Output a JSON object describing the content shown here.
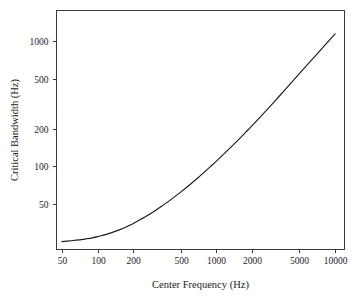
{
  "chart_data": {
    "type": "line",
    "title": "",
    "subtitle": "",
    "xlabel": "Center Frequency (Hz)",
    "ylabel": "Critical Bandwidth (Hz)",
    "xscale": "log",
    "yscale": "log",
    "xlim": [
      45,
      12000
    ],
    "ylim": [
      22,
      1750
    ],
    "grid": false,
    "legend": null,
    "xticks": [
      50,
      100,
      200,
      500,
      1000,
      2000,
      5000,
      10000
    ],
    "xtick_labels": [
      "50",
      "100",
      "200",
      "500",
      "1000",
      "2000",
      "5000",
      "10000"
    ],
    "yticks": [
      50,
      100,
      200,
      500,
      1000
    ],
    "ytick_labels": [
      "50",
      "100",
      "200",
      "500",
      "1000"
    ],
    "series": [
      {
        "name": "Critical Bandwidth",
        "x": [
          50,
          60,
          70,
          80,
          90,
          100,
          120,
          150,
          180,
          200,
          250,
          300,
          350,
          400,
          500,
          600,
          700,
          800,
          900,
          1000,
          1200,
          1500,
          1800,
          2000,
          2500,
          3000,
          3500,
          4000,
          5000,
          6000,
          7000,
          8000,
          9000,
          10000
        ],
        "y": [
          25.2,
          25.6,
          26.0,
          26.5,
          27.0,
          27.6,
          28.9,
          31.1,
          33.5,
          35.2,
          39.5,
          44.0,
          48.6,
          53.2,
          62.5,
          71.9,
          81.4,
          91.0,
          100.6,
          110.3,
          130.0,
          160.1,
          190.9,
          211.8,
          265.3,
          320.3,
          376.4,
          433.3,
          548.6,
          665.5,
          783.4,
          902.0,
          1021.2,
          1140.9
        ]
      }
    ],
    "annotations": []
  },
  "axes": {
    "x_title": "Center Frequency (Hz)",
    "y_title": "Critical Bandwidth (Hz)"
  },
  "colors": {
    "curve": "#1c1c1c",
    "frame": "#3a3a3a",
    "text": "#1a1a1a",
    "background": "#ffffff"
  }
}
